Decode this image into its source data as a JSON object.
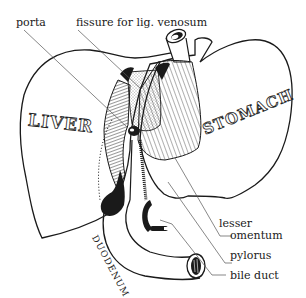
{
  "diagram": {
    "type": "anatomical",
    "organ_labels": {
      "liver": "LIVER",
      "stomach": "STOMACH",
      "duodenum": "DUODENUM"
    },
    "callouts": [
      {
        "id": "porta",
        "text": "porta"
      },
      {
        "id": "fissure",
        "text": "fissure for lig. venosum"
      },
      {
        "id": "lesser_1",
        "text": "lesser"
      },
      {
        "id": "lesser_2",
        "text": "omentum"
      },
      {
        "id": "pylorus",
        "text": "pylorus"
      },
      {
        "id": "bile_duct",
        "text": "bile duct"
      }
    ],
    "colors": {
      "ink": "#1a1a1a",
      "background": "#ffffff"
    }
  }
}
